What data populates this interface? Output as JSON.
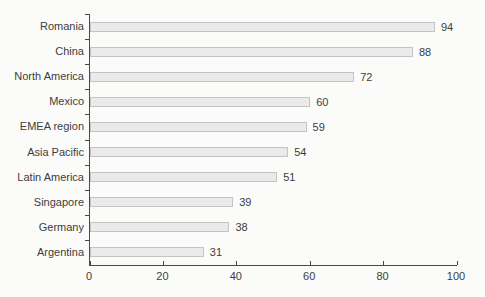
{
  "chart_data": {
    "type": "bar",
    "orientation": "horizontal",
    "title": "",
    "xlabel": "",
    "ylabel": "",
    "categories": [
      "Romania",
      "China",
      "North America",
      "Mexico",
      "EMEA region",
      "Asia Pacific",
      "Latin America",
      "Singapore",
      "Germany",
      "Argentina"
    ],
    "values": [
      94,
      88,
      72,
      60,
      59,
      54,
      51,
      39,
      38,
      31
    ],
    "value_labels_shown": true,
    "xlim": [
      0,
      100
    ],
    "x_ticks": [
      0,
      20,
      40,
      60,
      80,
      100
    ],
    "grid": false,
    "legend": false
  },
  "colors": {
    "background": "#fbfbfa",
    "bar_fill": "#eaeaea",
    "bar_border": "#c4c4c4",
    "axis": "#4a4a4a",
    "text": "#3d3d3d"
  }
}
